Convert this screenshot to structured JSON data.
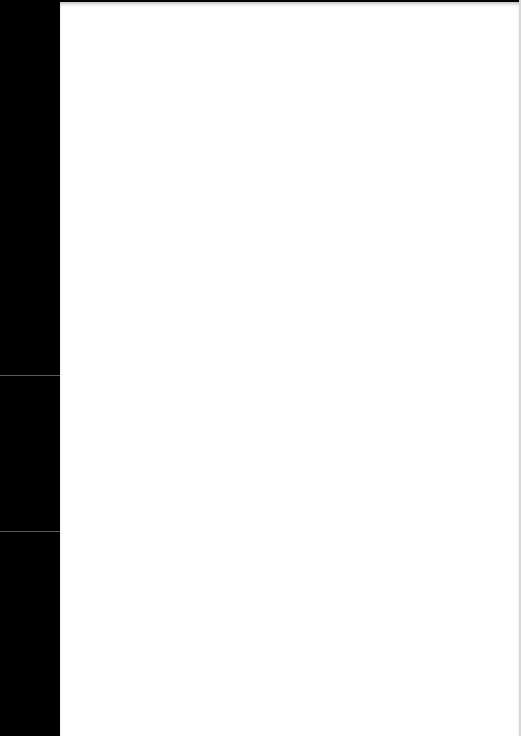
{
  "document": {
    "type": "scanned blank page",
    "background_color": "#ffffff",
    "left_margin_color": "#000000",
    "bleed_through_text": {
      "line_1": "",
      "line_2": ""
    },
    "margin_marks": [
      "",
      "",
      ""
    ]
  }
}
